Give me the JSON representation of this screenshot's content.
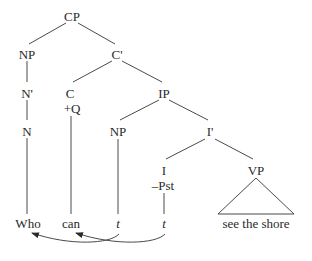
{
  "diagram": {
    "type": "syntax-tree",
    "nodes": {
      "cp": "CP",
      "np_spec": "NP",
      "c_bar": "C'",
      "n_bar": "N'",
      "n": "N",
      "c": "C",
      "c_feature": "+Q",
      "ip": "IP",
      "np_subj": "NP",
      "i_bar": "I'",
      "i": "I",
      "i_feature": "–Pst",
      "vp": "VP"
    },
    "leaves": {
      "who": "Who",
      "can": "can",
      "trace_np": "t",
      "trace_i": "t",
      "vp_phrase": "see the shore"
    },
    "movements": [
      {
        "from": "trace_np",
        "to": "who"
      },
      {
        "from": "trace_i",
        "to": "can"
      }
    ]
  }
}
